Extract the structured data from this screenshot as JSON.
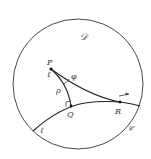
{
  "diagram": {
    "region_label": "𝒟",
    "boundary_label": "𝒞",
    "line_label_bottom": "ℓ",
    "points": {
      "P": {
        "label": "P",
        "sub_label": "ℓ"
      },
      "Q": {
        "label": "Q"
      },
      "R": {
        "label": "R"
      }
    },
    "segment_labels": {
      "PQ": "ρ",
      "PR": "φ"
    },
    "annotations": {
      "right_angle_at": "Q",
      "arrow_direction": "right"
    },
    "colors": {
      "stroke": "#333333",
      "background": "#ffffff"
    }
  }
}
